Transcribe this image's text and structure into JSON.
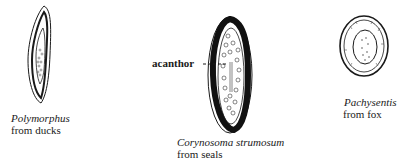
{
  "figure": {
    "specimens": [
      {
        "id": "polymorphus",
        "genus": "Polymorphus",
        "host": "from ducks",
        "shape": "spindle-elongate"
      },
      {
        "id": "corynosoma",
        "genus": "Corynosoma strumosum",
        "host": "from seals",
        "shape": "elongate-oval-thick-shell"
      },
      {
        "id": "pachysentis",
        "genus": "Pachysentis",
        "host": "from fox",
        "shape": "oval"
      }
    ],
    "annotations": [
      {
        "text": "acanthor",
        "target": "corynosoma"
      }
    ],
    "colors": {
      "ink": "#1a1a1a",
      "background": "#ffffff"
    }
  }
}
